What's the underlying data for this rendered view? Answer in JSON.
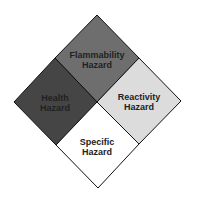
{
  "diagram": {
    "outline_color": "#111111",
    "quadrants": [
      {
        "id": "flammability",
        "line1": "Flammability",
        "line2": "Hazard",
        "color": "#6e6e6e"
      },
      {
        "id": "health",
        "line1": "Health",
        "line2": "Hazard",
        "color": "#454545"
      },
      {
        "id": "reactivity",
        "line1": "Reactivity",
        "line2": "Hazard",
        "color": "#dcdcdc"
      },
      {
        "id": "specific",
        "line1": "Specific",
        "line2": "Hazard",
        "color": "#ffffff"
      }
    ]
  }
}
